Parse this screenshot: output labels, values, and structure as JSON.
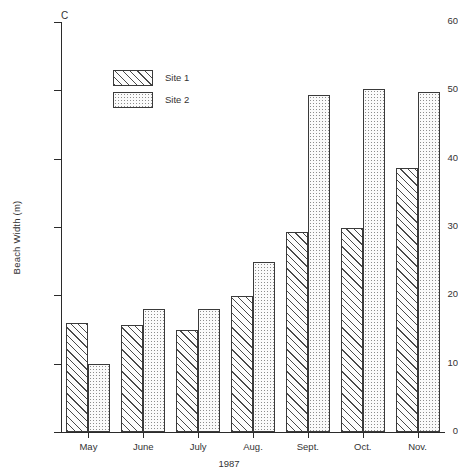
{
  "panel": {
    "letter": "C"
  },
  "chart_data": {
    "type": "bar",
    "title": "",
    "panel_label": "C",
    "xlabel": "1987",
    "ylabel": "Beach Width (m)",
    "ylim": [
      0,
      60
    ],
    "yticks": [
      0,
      10,
      20,
      30,
      40,
      50,
      60
    ],
    "ytick_labels": [
      "0",
      "10",
      "20",
      "30",
      "40",
      "50",
      "60"
    ],
    "grid": false,
    "legend_position": "upper-left-inside",
    "categories": [
      "May",
      "June",
      "July",
      "Aug.",
      "Sept.",
      "Oct.",
      "Nov."
    ],
    "series": [
      {
        "name": "Site 1",
        "fill": "hatch",
        "values": [
          15.9,
          15.7,
          15.0,
          19.9,
          29.3,
          29.8,
          38.6
        ]
      },
      {
        "name": "Site 2",
        "fill": "dots",
        "values": [
          10.0,
          18.0,
          18.0,
          24.9,
          49.3,
          50.2,
          49.8
        ]
      }
    ]
  },
  "legend": {
    "items": [
      {
        "label": "Site 1",
        "fill": "hatch"
      },
      {
        "label": "Site 2",
        "fill": "dots"
      }
    ]
  }
}
